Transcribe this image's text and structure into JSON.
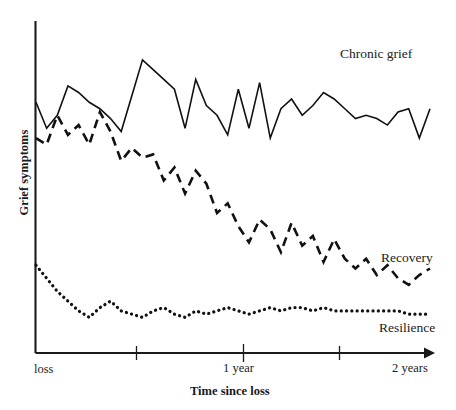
{
  "chart_data": {
    "type": "line",
    "title": "",
    "xlabel": "Time since loss",
    "ylabel": "Grief symptoms",
    "grid": false,
    "legend_position": "inline-right",
    "x_tick_labels": [
      "loss",
      "1 year",
      "2 years"
    ],
    "x_tick_positions_frac": [
      0.0,
      0.52,
      1.0
    ],
    "x_minor_tick_positions_frac": [
      0.254,
      0.763
    ],
    "xlim": [
      0,
      24
    ],
    "ylim": [
      0,
      100
    ],
    "x_unit": "months since loss",
    "axis_values_shown": false,
    "series": [
      {
        "name": "Chronic grief",
        "style": "solid",
        "label": "Chronic grief",
        "values": [
          76,
          68,
          72,
          81,
          79,
          76,
          74,
          71,
          67,
          78,
          89,
          86,
          83,
          80,
          68,
          83,
          75,
          72,
          66,
          80,
          68,
          82,
          65,
          74,
          77,
          72,
          75,
          79,
          77,
          74,
          71,
          72,
          71,
          69,
          73,
          74,
          65,
          74
        ]
      },
      {
        "name": "Recovery",
        "style": "dashed",
        "label": "Recovery",
        "values": [
          65,
          63,
          72,
          66,
          69,
          63,
          73,
          67,
          58,
          62,
          59,
          60,
          52,
          56,
          48,
          55,
          51,
          42,
          45,
          38,
          33,
          40,
          37,
          30,
          39,
          32,
          35,
          27,
          34,
          28,
          25,
          28,
          23,
          26,
          22,
          20,
          23,
          25
        ]
      },
      {
        "name": "Resilience",
        "style": "dotted",
        "label": "Resilience",
        "values": [
          26,
          22,
          18,
          15,
          12,
          10,
          13,
          15,
          12,
          11,
          10,
          12,
          13,
          11,
          10,
          12,
          11,
          12,
          13,
          12,
          11,
          12,
          13,
          12,
          13,
          13,
          12,
          13,
          12,
          12,
          12,
          12,
          12,
          12,
          12,
          11,
          11,
          11
        ]
      }
    ]
  },
  "labels": {
    "chronic_grief": "Chronic grief",
    "recovery": "Recovery",
    "resilience": "Resilience",
    "loss": "loss",
    "one_year": "1 year",
    "two_years": "2 years",
    "x_axis_title": "Time since loss",
    "y_axis_title": "Grief symptoms"
  },
  "colors": {
    "ink": "#111111",
    "background": "#ffffff"
  }
}
